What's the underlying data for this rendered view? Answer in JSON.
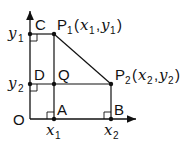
{
  "diagram": {
    "type": "coordinate-geometry",
    "points": {
      "O": {
        "label": "O"
      },
      "C": {
        "label": "C"
      },
      "D": {
        "label": "D"
      },
      "Q": {
        "label": "Q"
      },
      "A": {
        "label": "A"
      },
      "B": {
        "label": "B"
      },
      "P1": {
        "label": "P",
        "sub": "1",
        "coords": "(x1, y1)"
      },
      "P2": {
        "label": "P",
        "sub": "2",
        "coords": "(x2, y2)"
      }
    },
    "axis_labels": {
      "y1": {
        "var": "y",
        "sub": "1"
      },
      "y2": {
        "var": "y",
        "sub": "2"
      },
      "x1": {
        "var": "x",
        "sub": "1"
      },
      "x2": {
        "var": "x",
        "sub": "2"
      }
    },
    "p1_label": {
      "p": "P",
      "psub": "1",
      "open": "(",
      "x": "x",
      "xsub": "1",
      "comma": ",",
      "y": "y",
      "ysub": "1",
      "close": ")"
    },
    "p2_label": {
      "p": "P",
      "psub": "2",
      "open": "(",
      "x": "x",
      "xsub": "2",
      "comma": ",",
      "y": "y",
      "ysub": "2",
      "close": ")"
    },
    "colors": {
      "stroke": "#111111",
      "background": "#ffffff"
    }
  }
}
